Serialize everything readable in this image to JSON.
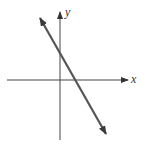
{
  "diagram": {
    "type": "coordinate-plane-line",
    "axes": {
      "x_label": "x",
      "y_label": "y",
      "color": "#444444"
    },
    "line": {
      "description": "straight line with negative slope, arrows at both ends",
      "slope_sign": "negative",
      "y_intercept": "positive",
      "x_intercept": "positive",
      "color": "#555555"
    }
  }
}
